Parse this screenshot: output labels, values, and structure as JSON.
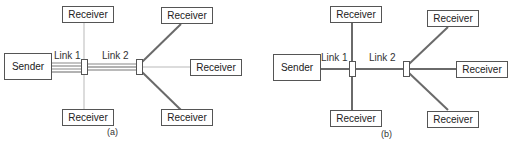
{
  "figure": {
    "panels": [
      {
        "id": "a",
        "caption": "(a)",
        "sender": "Sender",
        "receivers": [
          "Receiver",
          "Receiver",
          "Receiver",
          "Receiver",
          "Receiver",
          "Receiver"
        ],
        "links": [
          "Link 1",
          "Link 2"
        ],
        "description": "Separate unicast copies per receiver"
      },
      {
        "id": "b",
        "caption": "(b)",
        "sender": "Sender",
        "receivers": [
          "Receiver",
          "Receiver",
          "Receiver",
          "Receiver",
          "Receiver",
          "Receiver"
        ],
        "links": [
          "Link 1",
          "Link 2"
        ],
        "description": "Single multicast copy per link"
      }
    ],
    "colors": {
      "line_dark": "#6a6a6a",
      "line_light": "#d0d0d0",
      "box_border": "#555555"
    }
  }
}
